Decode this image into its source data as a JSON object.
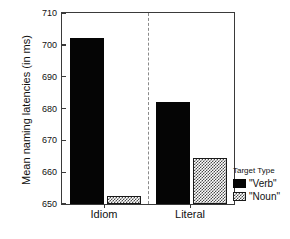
{
  "chart_data": {
    "type": "bar",
    "title": "",
    "xlabel": "",
    "ylabel": "Mean naming latencies (in ms)",
    "categories": [
      "Idiom",
      "Literal"
    ],
    "series": [
      {
        "name": "\"Verb\"",
        "values": [
          702,
          682
        ],
        "style": "solid-black"
      },
      {
        "name": "\"Noun\"",
        "values": [
          652.5,
          664.5
        ],
        "style": "hatched"
      }
    ],
    "ylim": [
      650,
      710
    ],
    "yticks": [
      650,
      660,
      670,
      680,
      690,
      700,
      710
    ],
    "ytick_labels": [
      "650",
      "660",
      "670",
      "680",
      "690",
      "700",
      "710"
    ],
    "grid": false,
    "legend_position": "right-bottom-outside",
    "annotations": [
      "vertical dashed divider between Idiom and Literal groups"
    ]
  },
  "legend": {
    "title": "Target Type",
    "entries": [
      {
        "label": "\"Verb\"",
        "swatch": "solid-black"
      },
      {
        "label": "\"Noun\"",
        "swatch": "hatched"
      }
    ]
  },
  "colors": {
    "verb_fill": "#050505",
    "noun_fill": "#ffffff",
    "noun_hatch": "#4a4a4a",
    "axis": "#3a3a3a",
    "divider": "#8a8a8a",
    "background": "#ffffff"
  }
}
